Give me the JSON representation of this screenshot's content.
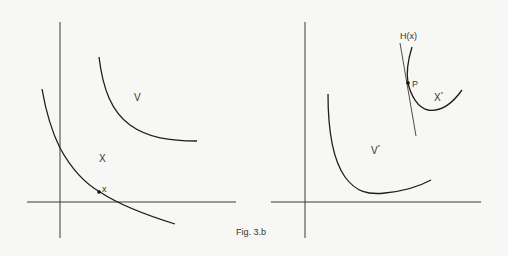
{
  "figure": {
    "caption": "Fig. 3.b"
  },
  "left_panel": {
    "labels": {
      "upper_set": "V",
      "lower_set": "X",
      "point": "x"
    }
  },
  "right_panel": {
    "labels": {
      "hyperplane": "H(x)",
      "point": "P",
      "dual_set_x_base": "X",
      "dual_set_x_sup": "*",
      "dual_set_v_base": "V",
      "dual_set_v_sup": "*"
    }
  },
  "colors": {
    "background": "#f7f7f5",
    "ink": "#1e1e1e"
  }
}
